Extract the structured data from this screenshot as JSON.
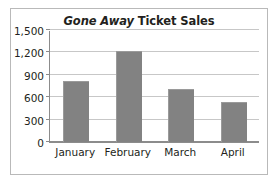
{
  "figure": {
    "title_italic_part": "Gone Away",
    "title_roman_part": " Ticket Sales",
    "border_color": "#b9b9b9",
    "background_color": "#ffffff"
  },
  "chart_data": {
    "type": "bar",
    "title": "Gone Away Ticket Sales",
    "categories": [
      "January",
      "February",
      "March",
      "April"
    ],
    "values": [
      800,
      1200,
      700,
      520
    ],
    "xlabel": "",
    "ylabel": "",
    "ylim": [
      0,
      1500
    ],
    "ytick_step": 300,
    "ytick_labels": [
      "1,500",
      "1,200",
      "900",
      "600",
      "300",
      "0"
    ],
    "ytick_values": [
      1500,
      1200,
      900,
      600,
      300,
      0
    ],
    "grid": true,
    "legend": false,
    "bar_color": "#828282",
    "gridline_color": "#c7c7c7",
    "axis_color": "#8c8c8c"
  }
}
